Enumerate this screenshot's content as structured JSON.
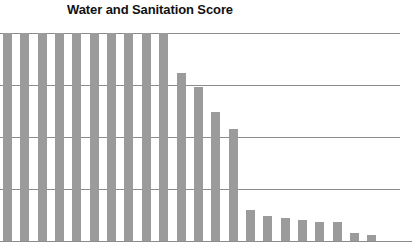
{
  "chart": {
    "title": "Water and Sanitation Score",
    "bar_color": "#9b9b9b",
    "gridline_color": "#8c8c8c",
    "background_color": "#ffffff"
  },
  "chart_data": {
    "type": "bar",
    "title": "Water and Sanitation Score",
    "xlabel": "",
    "ylabel": "",
    "ylim": [
      0,
      100
    ],
    "yticks": [
      0,
      25,
      50,
      75,
      100
    ],
    "grid": true,
    "legend": "none",
    "categories": [
      "1",
      "2",
      "3",
      "4",
      "5",
      "6",
      "7",
      "8",
      "9",
      "10",
      "11",
      "12",
      "13",
      "14",
      "15",
      "16",
      "17",
      "18",
      "19",
      "20",
      "21",
      "22"
    ],
    "values": [
      100,
      100,
      100,
      100,
      100,
      100,
      100,
      100,
      100,
      100,
      81,
      74,
      62,
      54,
      15,
      12,
      11,
      10,
      9,
      9,
      4,
      3
    ]
  }
}
